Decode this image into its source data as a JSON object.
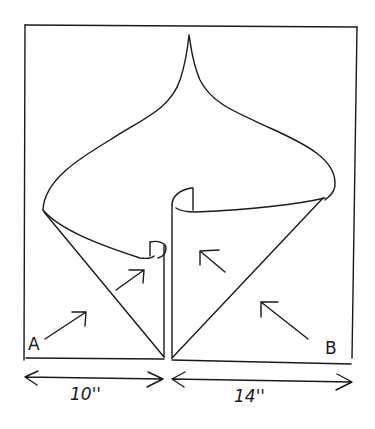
{
  "diagram": {
    "type": "hand-drawn sketch",
    "labels": {
      "left_point": "A",
      "right_point": "B"
    },
    "dimensions": {
      "left_width": "10''",
      "right_width": "14''"
    },
    "arrows": [
      {
        "id": "arrow-a-outer",
        "direction": "up-right"
      },
      {
        "id": "arrow-a-inner",
        "direction": "up-right"
      },
      {
        "id": "arrow-b-inner",
        "direction": "up-left"
      },
      {
        "id": "arrow-b-outer",
        "direction": "up-left"
      }
    ],
    "colors": {
      "ink": "#1a1a1a",
      "paper": "#ffffff"
    }
  }
}
